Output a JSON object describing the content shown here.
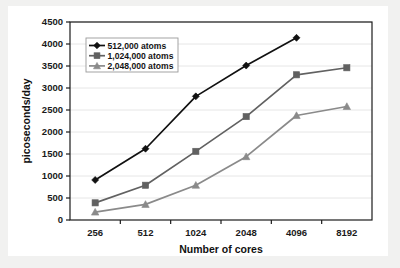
{
  "chart_data": {
    "type": "line",
    "title": "",
    "xlabel": "Number of cores",
    "ylabel": "picoseconds/day",
    "categories": [
      "256",
      "512",
      "1024",
      "2048",
      "4096",
      "8192"
    ],
    "xtick_labels": [
      "256",
      "512",
      "1024",
      "2048",
      "4096",
      "8192"
    ],
    "ytick_labels": [
      "0",
      "500",
      "1000",
      "1500",
      "2000",
      "2500",
      "3000",
      "3500",
      "4000",
      "4500"
    ],
    "yticks": [
      0,
      500,
      1000,
      1500,
      2000,
      2500,
      3000,
      3500,
      4000,
      4500
    ],
    "ylim": [
      0,
      4500
    ],
    "grid": true,
    "grid_axis": "y",
    "legend_position": "upper-left-inside",
    "series": [
      {
        "name": "512,000 atoms",
        "marker": "diamond",
        "color": "#111111",
        "values": [
          910,
          1620,
          2810,
          3510,
          4140,
          null
        ]
      },
      {
        "name": "1,024,000 atoms",
        "marker": "square",
        "color": "#616161",
        "values": [
          390,
          790,
          1560,
          2350,
          3300,
          3460
        ]
      },
      {
        "name": "2,048,000 atoms",
        "marker": "triangle",
        "color": "#8a8a8a",
        "values": [
          180,
          355,
          790,
          1440,
          2375,
          2580
        ]
      }
    ]
  },
  "colors": {
    "plot_background": "#ffffff",
    "page_background": "#f1f1f0",
    "axis": "#1b1b1b",
    "gridline": "#e6e6e6",
    "series_1": "#111111",
    "series_2": "#616161",
    "series_3": "#8a8a8a",
    "text": "#111111"
  },
  "legend": {
    "entries": [
      {
        "label": "512,000 atoms",
        "marker": "diamond-marker",
        "color": "#111111"
      },
      {
        "label": "1,024,000 atoms",
        "marker": "square-marker",
        "color": "#616161"
      },
      {
        "label": "2,048,000 atoms",
        "marker": "triangle-marker",
        "color": "#8a8a8a"
      }
    ]
  }
}
